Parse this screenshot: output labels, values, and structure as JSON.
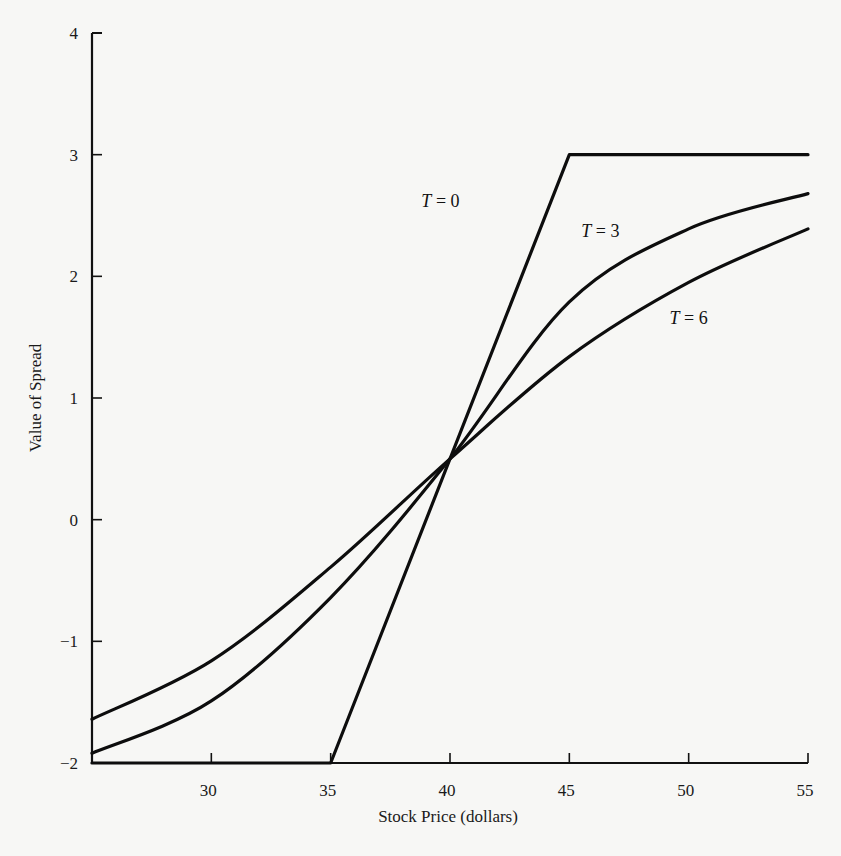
{
  "chart_data": {
    "type": "line",
    "title": "",
    "xlabel": "Stock Price (dollars)",
    "ylabel": "Value of Spread",
    "xlim": [
      25,
      55
    ],
    "ylim": [
      -2,
      4
    ],
    "xticks": [
      30,
      35,
      40,
      45,
      50,
      55
    ],
    "yticks": [
      -2,
      -1,
      0,
      1,
      2,
      3,
      4
    ],
    "xtick_labels": [
      "30",
      "35",
      "40",
      "45",
      "50",
      "55"
    ],
    "ytick_labels": [
      "−2",
      "−1",
      "0",
      "1",
      "2",
      "3",
      "4"
    ],
    "grid": false,
    "legend": "inline labels",
    "series": [
      {
        "name": "T = 0",
        "label_var": "T",
        "label_val": "0",
        "x": [
          25,
          35,
          45,
          55
        ],
        "y": [
          -2,
          -2,
          3,
          3
        ]
      },
      {
        "name": "T = 3",
        "label_var": "T",
        "label_val": "3",
        "x": [
          25,
          30,
          35,
          40,
          45,
          50,
          55
        ],
        "y": [
          -1.92,
          -1.49,
          -0.64,
          0.5,
          1.79,
          2.39,
          2.68
        ]
      },
      {
        "name": "T = 6",
        "label_var": "T",
        "label_val": "6",
        "x": [
          25,
          30,
          35,
          40,
          45,
          50,
          55
        ],
        "y": [
          -1.64,
          -1.16,
          -0.39,
          0.5,
          1.34,
          1.95,
          2.39
        ]
      }
    ],
    "annotations": [
      {
        "text": "T = 0",
        "x": 39.6,
        "y": 2.62
      },
      {
        "text": "T = 3",
        "x": 46.3,
        "y": 2.37
      },
      {
        "text": "T = 6",
        "x": 50.0,
        "y": 1.66
      }
    ]
  }
}
